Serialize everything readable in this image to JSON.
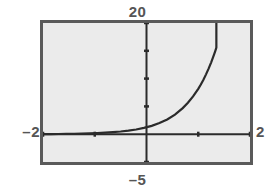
{
  "window": {
    "title": "graphing-calculator-plot"
  },
  "labels": {
    "ymax": "20",
    "ymin": "–5",
    "xmin": "–2",
    "xmax": "2"
  },
  "colors": {
    "frame": "#5a5a5a",
    "screen_background": "#ebebeb",
    "page_background": "#ffffff",
    "axis": "#2b2b2b",
    "curve": "#2b2b2b",
    "label_text": "#555555"
  },
  "chart_data": {
    "type": "line",
    "title": "",
    "xlabel": "",
    "ylabel": "",
    "xlim": [
      -2,
      2
    ],
    "ylim": [
      -5,
      20
    ],
    "grid": false,
    "legend": null,
    "axis_ticks": {
      "x_interval": 1,
      "x": [
        -2,
        -1,
        0,
        1,
        2
      ],
      "y_interval": 5,
      "y": [
        -5,
        0,
        5,
        10,
        15,
        20
      ]
    },
    "axis_origin": [
      0,
      0
    ],
    "series": [
      {
        "name": "exponential",
        "x": [
          -2.0,
          -1.85,
          -1.7,
          -1.55,
          -1.4,
          -1.25,
          -1.1,
          -0.95,
          -0.8,
          -0.65,
          -0.5,
          -0.35,
          -0.2,
          -0.05,
          0.1,
          0.25,
          0.4,
          0.55,
          0.7,
          0.8,
          0.9,
          1.0,
          1.05,
          1.1,
          1.15,
          1.2,
          1.25,
          1.28,
          1.31,
          1.33,
          1.35
        ],
        "y": [
          0.02,
          0.03,
          0.04,
          0.06,
          0.08,
          0.11,
          0.15,
          0.2,
          0.27,
          0.36,
          0.48,
          0.64,
          0.85,
          1.13,
          1.5,
          2.0,
          2.66,
          3.53,
          4.7,
          5.65,
          6.79,
          8.16,
          8.95,
          9.81,
          10.76,
          11.79,
          12.93,
          13.67,
          14.45,
          14.99,
          15.56
        ]
      }
    ]
  }
}
